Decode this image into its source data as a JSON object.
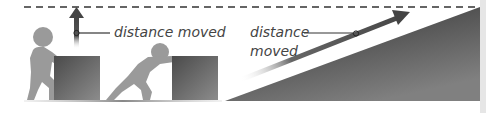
{
  "diagram": {
    "left_panel": {
      "label": "distance moved",
      "description": "Person lifting a box vertically; arrow shows upward distance moved"
    },
    "right_panel": {
      "label_line1": "distance",
      "label_line2": "moved",
      "description": "Box pushed up a ramp; arrow shows distance moved along the slope"
    },
    "colors": {
      "figure": "#9a9a9a",
      "box_dark": "#555555",
      "box_light": "#8a8a8a",
      "arrow": "#555555",
      "dashed_line": "#333333",
      "ramp_dark": "#3a3a3a",
      "ramp_light": "#777777",
      "text": "#444444"
    }
  }
}
